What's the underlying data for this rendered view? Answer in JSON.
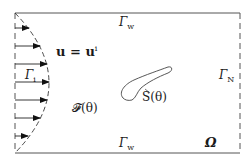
{
  "diagram": {
    "labels": {
      "inlet_velocity": "u = u",
      "inlet_velocity_sup": "i",
      "inlet_boundary": "Γ",
      "inlet_boundary_sub": "i",
      "wall_top": "Γ",
      "wall_top_sub": "w",
      "wall_bottom": "Γ",
      "wall_bottom_sub": "w",
      "outlet_boundary": "Γ",
      "outlet_boundary_sub": "N",
      "fluid_region": "𝓕(θ)",
      "solid_obstacle": "S(θ)",
      "domain": "Ω"
    },
    "inlet_profile": {
      "shape": "parabolic",
      "arrow_count": 7
    },
    "colors": {
      "stroke": "#333333",
      "text": "#1a1a1a",
      "background": "#ffffff"
    }
  }
}
